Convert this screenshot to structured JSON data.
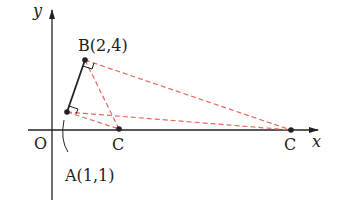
{
  "diagram": {
    "axes": {
      "x_label": "x",
      "y_label": "y",
      "origin_label": "O"
    },
    "points": {
      "A": {
        "label": "A(1,1)",
        "x": 1,
        "y": 1
      },
      "B": {
        "label": "B(2,4)",
        "x": 2,
        "y": 4
      },
      "C1": {
        "label": "C"
      },
      "C2": {
        "label": "C"
      }
    },
    "colors": {
      "axis": "#222222",
      "solid_segment": "#222222",
      "dashed": "#e8685e",
      "point": "#222222"
    }
  }
}
